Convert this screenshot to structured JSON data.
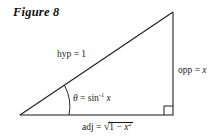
{
  "figure": {
    "caption": "Figure 8",
    "background_color": "#ffffff",
    "stroke_color": "#1a1a1a",
    "text_color": "#1a1a1a"
  },
  "labels": {
    "hypotenuse": {
      "text": "hyp = 1",
      "prefix": "hyp = ",
      "value": "1"
    },
    "opposite": {
      "text": "opp = x",
      "prefix": "opp = ",
      "value": "x"
    },
    "angle": {
      "text": "θ = sin-1 x",
      "symbol": "θ",
      "equals": " = ",
      "function": "sin",
      "exponent": "-1",
      "argument": "x"
    },
    "adjacent": {
      "prefix": "adj = ",
      "radicand_lead": "1 − ",
      "radicand_var": "x",
      "radicand_exponent": "2",
      "radical_glyph": "√"
    }
  },
  "geometry": {
    "vertex_left": {
      "x": 20,
      "y": 115
    },
    "vertex_right": {
      "x": 173,
      "y": 115
    },
    "vertex_apex": {
      "x": 173,
      "y": 12
    },
    "right_angle_marker_size": 9,
    "angle_arc_radius": 44
  }
}
